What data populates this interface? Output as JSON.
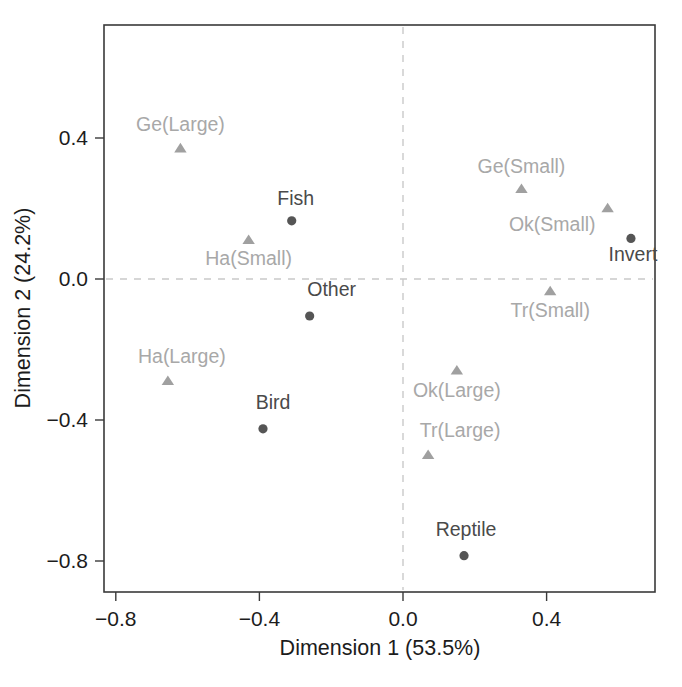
{
  "chart_data": {
    "type": "scatter",
    "title": "",
    "xlabel": "Dimension 1 (53.5%)",
    "ylabel": "Dimension 2 (24.2%)",
    "xlim": [
      -0.92,
      0.78
    ],
    "ylim": [
      -0.885,
      0.6
    ],
    "xticks": [
      -0.8,
      -0.4,
      0.0,
      0.4
    ],
    "xticklabels": [
      "−0.8",
      "−0.4",
      "0.0",
      "0.4"
    ],
    "yticks": [
      0.4,
      0.0,
      -0.4,
      -0.8
    ],
    "yticklabels": [
      "0.4",
      "0.0",
      "−0.4",
      "−0.8"
    ],
    "grid": false,
    "legend": "none",
    "reference_lines": {
      "vertical_x": 0.0,
      "horizontal_y": 0.0,
      "style": "dashed",
      "color": "#c9c9c9"
    },
    "marker_colors": {
      "dot": "#555555",
      "triangle": "#a0a0a0"
    },
    "label_colors": {
      "dark": "#4a4a4a",
      "light": "#a8a8a8"
    },
    "series": [
      {
        "name": "Prey category",
        "marker": "circle",
        "color": "#555555",
        "label_color": "#4a4a4a",
        "points": [
          {
            "label": "Fish",
            "x": -0.31,
            "y": 0.165,
            "label_dx": 4,
            "label_dy": -16,
            "anchor": "middle"
          },
          {
            "label": "Other",
            "x": -0.26,
            "y": -0.105,
            "label_dx": 22,
            "label_dy": -20,
            "anchor": "middle"
          },
          {
            "label": "Bird",
            "x": -0.39,
            "y": -0.425,
            "label_dx": 10,
            "label_dy": -20,
            "anchor": "middle"
          },
          {
            "label": "Invert",
            "x": 0.635,
            "y": 0.115,
            "label_dx": 2,
            "label_dy": 23,
            "anchor": "middle"
          },
          {
            "label": "Reptile",
            "x": 0.17,
            "y": -0.785,
            "label_dx": 2,
            "label_dy": -20,
            "anchor": "middle"
          }
        ]
      },
      {
        "name": "Habitat / size class",
        "marker": "triangle",
        "color": "#a0a0a0",
        "label_color": "#a8a8a8",
        "points": [
          {
            "label": "Ge(Large)",
            "x": -0.62,
            "y": 0.37,
            "label_dx": 0,
            "label_dy": -18,
            "anchor": "middle"
          },
          {
            "label": "Ha(Small)",
            "x": -0.43,
            "y": 0.11,
            "label_dx": 0,
            "label_dy": 25,
            "anchor": "middle"
          },
          {
            "label": "Ha(Large)",
            "x": -0.655,
            "y": -0.29,
            "label_dx": 14,
            "label_dy": -18,
            "anchor": "middle"
          },
          {
            "label": "Ge(Small)",
            "x": 0.33,
            "y": 0.255,
            "label_dx": 0,
            "label_dy": -16,
            "anchor": "middle"
          },
          {
            "label": "Ok(Small)",
            "x": 0.57,
            "y": 0.2,
            "label_dx": -12,
            "label_dy": 22,
            "anchor": "end"
          },
          {
            "label": "Tr(Small)",
            "x": 0.41,
            "y": -0.035,
            "label_dx": 0,
            "label_dy": 26,
            "anchor": "middle"
          },
          {
            "label": "Ok(Large)",
            "x": 0.15,
            "y": -0.26,
            "label_dx": 0,
            "label_dy": 26,
            "anchor": "middle"
          },
          {
            "label": "Tr(Large)",
            "x": 0.07,
            "y": -0.5,
            "label_dx": 32,
            "label_dy": -18,
            "anchor": "middle"
          }
        ]
      }
    ]
  },
  "axes": {
    "x_title": "Dimension 1 (53.5%)",
    "y_title": "Dimension 2 (24.2%)"
  }
}
